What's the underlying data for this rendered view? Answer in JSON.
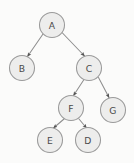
{
  "diagram": {
    "type": "tree-graph",
    "canvas": {
      "width": 134,
      "height": 163,
      "background": "#fbfbfa"
    },
    "style": {
      "node_fill": "#ededec",
      "node_stroke": "#9a9a9a",
      "node_radius": 12.5,
      "edge_color": "#8e8e8e",
      "arrow_color": "#555555",
      "label_color": "#4a4a4a"
    },
    "nodes": [
      {
        "id": "A",
        "label": "A",
        "cx": 52,
        "cy": 25,
        "r": 12.5,
        "level": 0
      },
      {
        "id": "B",
        "label": "B",
        "cx": 22,
        "cy": 68,
        "r": 12.5,
        "level": 1
      },
      {
        "id": "C",
        "label": "C",
        "cx": 89,
        "cy": 68,
        "r": 12.5,
        "level": 1
      },
      {
        "id": "F",
        "label": "F",
        "cx": 71,
        "cy": 108,
        "r": 12.5,
        "level": 2
      },
      {
        "id": "G",
        "label": "G",
        "cx": 113,
        "cy": 110,
        "r": 12.5,
        "level": 2
      },
      {
        "id": "E",
        "label": "E",
        "cx": 50,
        "cy": 140,
        "r": 12.5,
        "level": 3
      },
      {
        "id": "D",
        "label": "D",
        "cx": 88,
        "cy": 140,
        "r": 12.5,
        "level": 3
      }
    ],
    "edges": [
      {
        "id": "A-B",
        "from": "A",
        "to": "B",
        "directed": true,
        "x1": 43.0,
        "y1": 34.0,
        "x2": 27.5,
        "y2": 56.5
      },
      {
        "id": "A-C",
        "from": "A",
        "to": "C",
        "directed": true,
        "x1": 62.0,
        "y1": 32.5,
        "x2": 84.5,
        "y2": 56.0
      },
      {
        "id": "C-F",
        "from": "C",
        "to": "F",
        "directed": true,
        "x1": 84.0,
        "y1": 79.5,
        "x2": 73.5,
        "y2": 95.5
      },
      {
        "id": "C-G",
        "from": "C",
        "to": "G",
        "directed": true,
        "x1": 98.5,
        "y1": 77.5,
        "x2": 109.0,
        "y2": 97.5
      },
      {
        "id": "F-E",
        "from": "F",
        "to": "E",
        "directed": true,
        "x1": 64.0,
        "y1": 119.0,
        "x2": 53.5,
        "y2": 128.0
      },
      {
        "id": "F-D",
        "from": "F",
        "to": "D",
        "directed": true,
        "x1": 79.0,
        "y1": 119.0,
        "x2": 86.5,
        "y2": 128.0
      }
    ]
  }
}
